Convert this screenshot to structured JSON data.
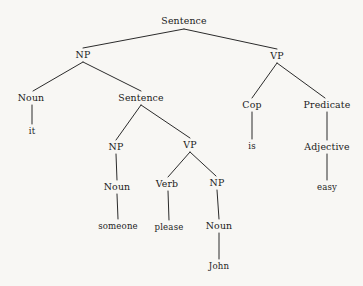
{
  "figure": {
    "kind": "syntax-parse-tree",
    "sentence": "it is easy someone please John",
    "background_color": "#f8f7f4",
    "text_color": "#191919",
    "edge_color": "#2b2b2b"
  },
  "nodes": [
    {
      "id": "s-root",
      "label": "Sentence",
      "type": "nonterminal",
      "x": 184,
      "y": 21
    },
    {
      "id": "np-1",
      "label": "NP",
      "type": "nonterminal",
      "x": 83,
      "y": 55
    },
    {
      "id": "vp-1",
      "label": "VP",
      "type": "nonterminal",
      "x": 277,
      "y": 56
    },
    {
      "id": "noun-1",
      "label": "Noun",
      "type": "nonterminal",
      "x": 31,
      "y": 98
    },
    {
      "id": "s-embedded",
      "label": "Sentence",
      "type": "nonterminal",
      "x": 141,
      "y": 98
    },
    {
      "id": "cop",
      "label": "Cop",
      "type": "nonterminal",
      "x": 252,
      "y": 105
    },
    {
      "id": "predicate",
      "label": "Predicate",
      "type": "nonterminal",
      "x": 327,
      "y": 105
    },
    {
      "id": "it",
      "label": "it",
      "type": "terminal",
      "x": 32,
      "y": 131
    },
    {
      "id": "np-2",
      "label": "NP",
      "type": "nonterminal",
      "x": 116,
      "y": 147
    },
    {
      "id": "vp-2",
      "label": "VP",
      "type": "nonterminal",
      "x": 190,
      "y": 145
    },
    {
      "id": "is",
      "label": "is",
      "type": "terminal",
      "x": 252,
      "y": 146
    },
    {
      "id": "adjective",
      "label": "Adjective",
      "type": "nonterminal",
      "x": 327,
      "y": 147
    },
    {
      "id": "noun-2",
      "label": "Noun",
      "type": "nonterminal",
      "x": 117,
      "y": 187
    },
    {
      "id": "verb",
      "label": "Verb",
      "type": "nonterminal",
      "x": 167,
      "y": 184
    },
    {
      "id": "np-3",
      "label": "NP",
      "type": "nonterminal",
      "x": 217,
      "y": 183
    },
    {
      "id": "easy",
      "label": "easy",
      "type": "terminal",
      "x": 327,
      "y": 187
    },
    {
      "id": "someone",
      "label": "someone",
      "type": "terminal",
      "x": 118,
      "y": 226
    },
    {
      "id": "please",
      "label": "please",
      "type": "terminal",
      "x": 169,
      "y": 227
    },
    {
      "id": "noun-3",
      "label": "Noun",
      "type": "nonterminal",
      "x": 219,
      "y": 226
    },
    {
      "id": "john",
      "label": "John",
      "type": "terminal",
      "x": 219,
      "y": 266
    }
  ],
  "edges": [
    {
      "from": "s-root",
      "to": "np-1",
      "x1": 184,
      "y1": 29,
      "x2": 83,
      "y2": 48
    },
    {
      "from": "s-root",
      "to": "vp-1",
      "x1": 184,
      "y1": 29,
      "x2": 277,
      "y2": 49
    },
    {
      "from": "np-1",
      "to": "noun-1",
      "x1": 83,
      "y1": 62,
      "x2": 33,
      "y2": 91
    },
    {
      "from": "np-1",
      "to": "s-embedded",
      "x1": 83,
      "y1": 62,
      "x2": 141,
      "y2": 91
    },
    {
      "from": "vp-1",
      "to": "cop",
      "x1": 277,
      "y1": 63,
      "x2": 252,
      "y2": 98
    },
    {
      "from": "vp-1",
      "to": "predicate",
      "x1": 277,
      "y1": 63,
      "x2": 325,
      "y2": 98
    },
    {
      "from": "noun-1",
      "to": "it",
      "x1": 32,
      "y1": 105,
      "x2": 32,
      "y2": 124
    },
    {
      "from": "s-embedded",
      "to": "np-2",
      "x1": 141,
      "y1": 105,
      "x2": 116,
      "y2": 140
    },
    {
      "from": "s-embedded",
      "to": "vp-2",
      "x1": 141,
      "y1": 105,
      "x2": 190,
      "y2": 138
    },
    {
      "from": "cop",
      "to": "is",
      "x1": 252,
      "y1": 112,
      "x2": 252,
      "y2": 139
    },
    {
      "from": "predicate",
      "to": "adjective",
      "x1": 327,
      "y1": 112,
      "x2": 327,
      "y2": 140
    },
    {
      "from": "np-2",
      "to": "noun-2",
      "x1": 116,
      "y1": 154,
      "x2": 117,
      "y2": 180
    },
    {
      "from": "vp-2",
      "to": "verb",
      "x1": 190,
      "y1": 152,
      "x2": 168,
      "y2": 177
    },
    {
      "from": "vp-2",
      "to": "np-3",
      "x1": 190,
      "y1": 152,
      "x2": 216,
      "y2": 176
    },
    {
      "from": "adjective",
      "to": "easy",
      "x1": 327,
      "y1": 154,
      "x2": 327,
      "y2": 180
    },
    {
      "from": "noun-2",
      "to": "someone",
      "x1": 117,
      "y1": 194,
      "x2": 118,
      "y2": 219
    },
    {
      "from": "verb",
      "to": "please",
      "x1": 168,
      "y1": 191,
      "x2": 169,
      "y2": 220
    },
    {
      "from": "np-3",
      "to": "noun-3",
      "x1": 217,
      "y1": 190,
      "x2": 219,
      "y2": 219
    },
    {
      "from": "noun-3",
      "to": "john",
      "x1": 219,
      "y1": 233,
      "x2": 219,
      "y2": 259
    }
  ]
}
